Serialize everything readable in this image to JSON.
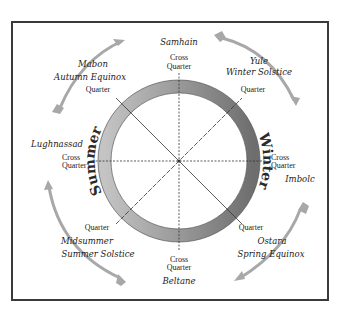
{
  "diagram": {
    "seasons": {
      "left": "Summer",
      "right": "Winter"
    },
    "ring_colors": {
      "light": "#c4c4c4",
      "dark": "#6e6e6e"
    },
    "arrow_color": "#a8a8a8",
    "festivals": [
      {
        "id": "samhain",
        "name": "Samhain",
        "subtitle": "",
        "marker_type": [
          "Cross",
          "Quarter"
        ],
        "direction": "top"
      },
      {
        "id": "yule",
        "name": "Yule",
        "subtitle": "Winter Solstice",
        "marker_type": [
          "Quarter"
        ],
        "direction": "top-right"
      },
      {
        "id": "imbolc",
        "name": "Imbolc",
        "subtitle": "",
        "marker_type": [
          "Cross",
          "Quarter"
        ],
        "direction": "right"
      },
      {
        "id": "ostara",
        "name": "Ostara",
        "subtitle": "Spring Equinox",
        "marker_type": [
          "Quarter"
        ],
        "direction": "bottom-right"
      },
      {
        "id": "beltane",
        "name": "Beltane",
        "subtitle": "",
        "marker_type": [
          "Cross",
          "Quarter"
        ],
        "direction": "bottom"
      },
      {
        "id": "midsummer",
        "name": "Midsummer",
        "subtitle": "Summer Solstice",
        "marker_type": [
          "Quarter"
        ],
        "direction": "bottom-left"
      },
      {
        "id": "lughnassad",
        "name": "Lughnassad",
        "subtitle": "",
        "marker_type": [
          "Cross",
          "Quarter"
        ],
        "direction": "left"
      },
      {
        "id": "mabon",
        "name": "Mabon",
        "subtitle": "Autumn Equinox",
        "marker_type": [
          "Quarter"
        ],
        "direction": "top-left"
      }
    ]
  }
}
